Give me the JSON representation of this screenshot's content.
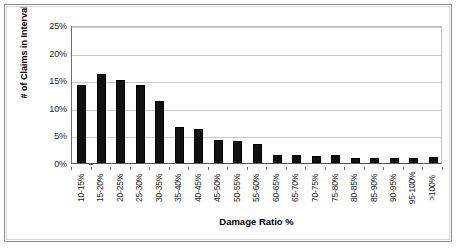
{
  "chart_data": {
    "type": "bar",
    "title": "",
    "xlabel": "Damage Ratio %",
    "ylabel": "# of Claims in Interval",
    "ylim": [
      0,
      25
    ],
    "ytick_labels": [
      "0%",
      "5%",
      "10%",
      "15%",
      "20%",
      "25%"
    ],
    "ytick_values": [
      0,
      5,
      10,
      15,
      20,
      25
    ],
    "grid": true,
    "legend": false,
    "bar_color": "#111111",
    "categories": [
      "10-15%",
      "15-20%",
      "20-25%",
      "25-30%",
      "30-35%",
      "35-40%",
      "40-45%",
      "45-50%",
      "50-55%",
      "55-60%",
      "60-65%",
      "65-70%",
      "70-75%",
      "75-80%",
      "80-85%",
      "85-90%",
      "90-95%",
      "95-100%",
      ">100%"
    ],
    "values": [
      14.1,
      16.1,
      15.1,
      14.2,
      11.3,
      6.6,
      6.2,
      4.2,
      4.0,
      3.4,
      1.5,
      1.4,
      1.3,
      1.4,
      0.9,
      0.9,
      0.9,
      0.9,
      1.0
    ]
  }
}
